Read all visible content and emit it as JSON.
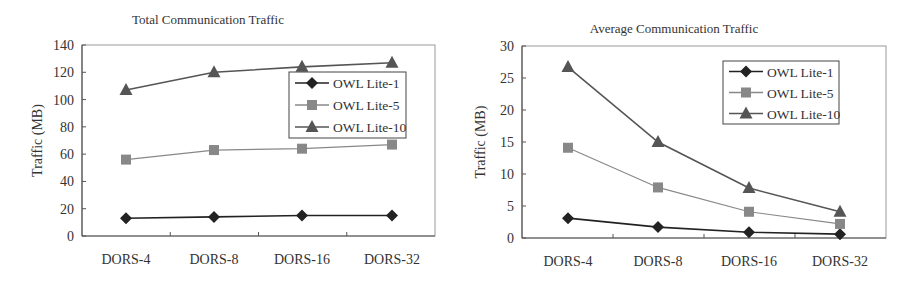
{
  "chart_data": [
    {
      "type": "line",
      "title": "Total Communication Traffic",
      "xlabel": "",
      "ylabel": "Traffic (MB)",
      "categories": [
        "DORS-4",
        "DORS-8",
        "DORS-16",
        "DORS-32"
      ],
      "ylim": [
        0,
        140
      ],
      "yticks": [
        0,
        20,
        40,
        60,
        80,
        100,
        120,
        140
      ],
      "grid": false,
      "legend_position": "upper right (inside)",
      "series": [
        {
          "name": "OWL Lite-1",
          "marker": "diamond",
          "color": "#222222",
          "values": [
            13,
            14,
            15,
            15
          ]
        },
        {
          "name": "OWL Lite-5",
          "marker": "square",
          "color": "#888888",
          "values": [
            56,
            63,
            64,
            67
          ]
        },
        {
          "name": "OWL Lite-10",
          "marker": "triangle",
          "color": "#555555",
          "values": [
            107,
            120,
            124,
            127
          ]
        }
      ]
    },
    {
      "type": "line",
      "title": "Average Communication Traffic",
      "xlabel": "",
      "ylabel": "Traffic (MB)",
      "categories": [
        "DORS-4",
        "DORS-8",
        "DORS-16",
        "DORS-32"
      ],
      "ylim": [
        0,
        30
      ],
      "yticks": [
        0,
        5,
        10,
        15,
        20,
        25,
        30
      ],
      "grid": false,
      "legend_position": "upper right (inside)",
      "series": [
        {
          "name": "OWL Lite-1",
          "marker": "diamond",
          "color": "#222222",
          "values": [
            3.1,
            1.7,
            0.9,
            0.6
          ]
        },
        {
          "name": "OWL Lite-5",
          "marker": "square",
          "color": "#888888",
          "values": [
            14.1,
            7.9,
            4.1,
            2.2
          ]
        },
        {
          "name": "OWL Lite-10",
          "marker": "triangle",
          "color": "#555555",
          "values": [
            26.7,
            15,
            7.8,
            4.1
          ]
        }
      ]
    }
  ],
  "layout": [
    {
      "x": 0,
      "plot": {
        "left": 82,
        "top": 45,
        "right": 435,
        "bottom": 236
      },
      "title_y": 24,
      "title_x": 208,
      "cat_x": [
        126,
        214,
        302,
        392
      ],
      "legend": {
        "x": 289,
        "y": 72,
        "w": 117,
        "h": 66
      }
    },
    {
      "x": 0,
      "plot": {
        "left": 522,
        "top": 46,
        "right": 886,
        "bottom": 238
      },
      "title_y": 33,
      "title_x": 674,
      "cat_x": [
        568,
        658,
        749,
        840
      ],
      "legend": {
        "x": 723,
        "y": 61,
        "w": 116,
        "h": 63
      }
    }
  ]
}
